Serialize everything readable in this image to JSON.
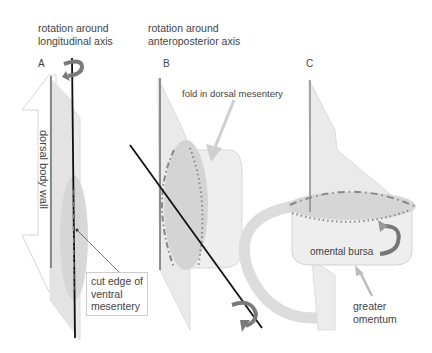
{
  "headers": {
    "rotation_longitudinal_line1": "rotation around",
    "rotation_longitudinal_line2": "longitudinal axis",
    "rotation_ap_line1": "rotation around",
    "rotation_ap_line2": "anteroposterior axis"
  },
  "panels": {
    "a": "A",
    "b": "B",
    "c": "C"
  },
  "labels": {
    "dorsal_body_wall": "dorsal body wall",
    "cut_edge_line1": "cut edge of",
    "cut_edge_line2": "ventral",
    "cut_edge_line3": "mesentery",
    "fold_dorsal_mesentery": "fold in dorsal mesentery",
    "omental_bursa": "omental bursa",
    "greater_omentum_line1": "greater",
    "greater_omentum_line2": "omentum"
  },
  "colors": {
    "sheet": "#e6e6e6",
    "sheet_dark": "#d2d2d2",
    "axis": "#111111",
    "rotation_arrow": "#7a7a7a",
    "pointer_arrow": "#cfcfcf",
    "dash": "#8a8a8a"
  }
}
